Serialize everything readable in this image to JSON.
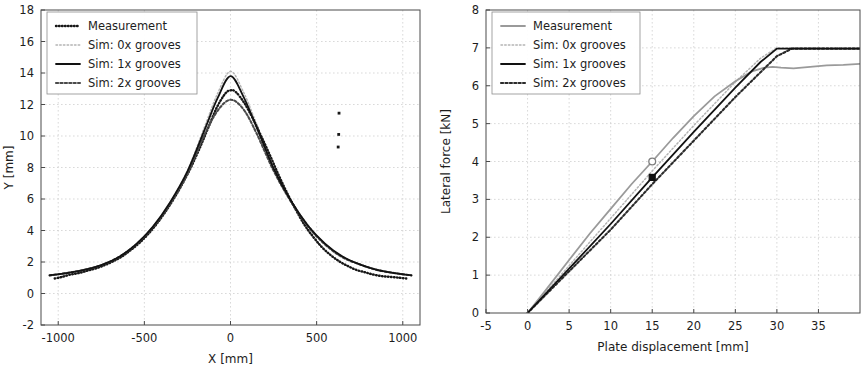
{
  "figure": {
    "background": "#ffffff",
    "panels": [
      "left",
      "right"
    ]
  },
  "series_style": {
    "measurement_color_left": "#171717",
    "measurement_color_right": "#9a9a9a",
    "sim0x_color": "#b4b4b4",
    "sim1x_color": "#121212",
    "sim2x_color": "#4a4a4a",
    "grid_color": "#c8c8c8",
    "frame_color": "#4a4a4a"
  },
  "chart_data": [
    {
      "id": "left",
      "type": "line",
      "title": "",
      "xlabel": "X [mm]",
      "ylabel": "Y [mm]",
      "xlim": [
        -1100,
        1100
      ],
      "ylim": [
        -2,
        18
      ],
      "xticks": [
        -1000,
        -500,
        0,
        500,
        1000
      ],
      "xticklabels": [
        "-1000",
        "-500",
        "0",
        "500",
        "1000"
      ],
      "yticks": [
        -2,
        0,
        2,
        4,
        6,
        8,
        10,
        12,
        14,
        16,
        18
      ],
      "yticklabels": [
        "-2",
        "0",
        "2",
        "4",
        "6",
        "8",
        "10",
        "12",
        "14",
        "16",
        "18"
      ],
      "grid": true,
      "legend_position": "upper-left",
      "legend": [
        "Measurement",
        "Sim: 0x grooves",
        "Sim: 1x grooves",
        "Sim: 2x grooves"
      ],
      "series": [
        {
          "name": "Measurement",
          "style": "dotted-markers",
          "color": "#171717",
          "x": [
            -1020,
            -980,
            -930,
            -880,
            -830,
            -780,
            -730,
            -680,
            -630,
            -580,
            -530,
            -480,
            -430,
            -380,
            -330,
            -280,
            -230,
            -180,
            -130,
            -80,
            -30,
            0,
            30,
            80,
            130,
            180,
            230,
            280,
            330,
            380,
            430,
            480,
            530,
            580,
            630,
            680,
            730,
            780,
            830,
            880,
            930,
            980,
            1020
          ],
          "y": [
            0.95,
            1.05,
            1.2,
            1.3,
            1.45,
            1.6,
            1.8,
            2.05,
            2.35,
            2.75,
            3.2,
            3.75,
            4.4,
            5.15,
            6.0,
            6.95,
            8.0,
            9.2,
            10.5,
            11.8,
            12.7,
            12.9,
            12.8,
            12.1,
            11.1,
            9.95,
            8.75,
            7.5,
            6.35,
            5.3,
            4.35,
            3.6,
            2.95,
            2.45,
            2.05,
            1.75,
            1.5,
            1.35,
            1.2,
            1.1,
            1.05,
            1.0,
            0.95
          ]
        },
        {
          "name": "Sim: 0x grooves",
          "style": "dotted",
          "color": "#b4b4b4",
          "x": [
            -1050,
            -950,
            -850,
            -750,
            -650,
            -550,
            -450,
            -350,
            -250,
            -150,
            -75,
            0,
            75,
            150,
            250,
            350,
            450,
            550,
            650,
            750,
            850,
            950,
            1050
          ],
          "y": [
            1.15,
            1.3,
            1.5,
            1.8,
            2.3,
            3.1,
            4.25,
            5.8,
            7.8,
            10.6,
            12.7,
            14.1,
            12.8,
            10.8,
            8.0,
            5.95,
            4.35,
            3.15,
            2.35,
            1.85,
            1.5,
            1.3,
            1.15
          ]
        },
        {
          "name": "Sim: 1x grooves",
          "style": "solid",
          "color": "#121212",
          "x": [
            -1050,
            -950,
            -850,
            -750,
            -650,
            -550,
            -450,
            -350,
            -250,
            -150,
            -75,
            0,
            75,
            150,
            250,
            350,
            450,
            550,
            650,
            750,
            850,
            950,
            1050
          ],
          "y": [
            1.15,
            1.3,
            1.5,
            1.8,
            2.3,
            3.1,
            4.25,
            5.8,
            7.75,
            10.4,
            12.4,
            13.8,
            12.5,
            10.6,
            7.95,
            5.9,
            4.3,
            3.15,
            2.35,
            1.85,
            1.5,
            1.3,
            1.15
          ]
        },
        {
          "name": "Sim: 2x grooves",
          "style": "dotted-thick",
          "color": "#4a4a4a",
          "x": [
            -1050,
            -950,
            -850,
            -750,
            -650,
            -550,
            -450,
            -350,
            -250,
            -150,
            -75,
            0,
            75,
            150,
            250,
            350,
            450,
            550,
            650,
            750,
            850,
            950,
            1050
          ],
          "y": [
            1.15,
            1.3,
            1.5,
            1.8,
            2.3,
            3.1,
            4.2,
            5.7,
            7.6,
            10.1,
            11.6,
            12.3,
            11.7,
            10.2,
            7.8,
            5.85,
            4.25,
            3.1,
            2.3,
            1.85,
            1.5,
            1.3,
            1.15
          ]
        }
      ],
      "outlier_points": [
        {
          "x": 630,
          "y": 11.45
        },
        {
          "x": 628,
          "y": 10.1
        },
        {
          "x": 625,
          "y": 9.3
        }
      ]
    },
    {
      "id": "right",
      "type": "line",
      "title": "",
      "xlabel": "Plate displacement [mm]",
      "ylabel": "Lateral force [kN]",
      "xlim": [
        -5,
        40
      ],
      "ylim": [
        0,
        8
      ],
      "xticks": [
        -5,
        0,
        5,
        10,
        15,
        20,
        25,
        30,
        35
      ],
      "xticklabels": [
        "-5",
        "0",
        "5",
        "10",
        "15",
        "20",
        "25",
        "30",
        "35"
      ],
      "yticks": [
        0,
        1,
        2,
        3,
        4,
        5,
        6,
        7,
        8
      ],
      "yticklabels": [
        "0",
        "1",
        "2",
        "3",
        "4",
        "5",
        "6",
        "7",
        "8"
      ],
      "grid": true,
      "legend_position": "upper-left",
      "legend": [
        "Measurement",
        "Sim: 0x grooves",
        "Sim: 1x grooves",
        "Sim: 2x grooves"
      ],
      "series": [
        {
          "name": "Measurement",
          "style": "solid",
          "color": "#9a9a9a",
          "x": [
            0,
            2,
            5,
            7.5,
            10,
            12.5,
            15,
            17.5,
            20,
            22.5,
            25,
            27,
            28.5,
            29.5,
            30.5,
            32,
            34,
            36,
            38,
            40
          ],
          "y": [
            0,
            0.55,
            1.4,
            2.1,
            2.75,
            3.4,
            4.0,
            4.62,
            5.2,
            5.72,
            6.12,
            6.38,
            6.48,
            6.5,
            6.48,
            6.46,
            6.5,
            6.54,
            6.55,
            6.58
          ]
        },
        {
          "name": "Sim: 0x grooves",
          "style": "dotted",
          "color": "#b4b4b4",
          "x": [
            0,
            5,
            10,
            15,
            20,
            25,
            28,
            30,
            32,
            35,
            40
          ],
          "y": [
            0,
            1.25,
            2.5,
            3.75,
            4.95,
            6.1,
            6.72,
            7.0,
            7.0,
            7.0,
            7.0
          ]
        },
        {
          "name": "Sim: 1x grooves",
          "style": "solid",
          "color": "#121212",
          "x": [
            0,
            5,
            10,
            15,
            20,
            25,
            28,
            30,
            32,
            35,
            40
          ],
          "y": [
            0,
            1.17,
            2.35,
            3.58,
            4.78,
            5.95,
            6.62,
            6.98,
            6.98,
            6.98,
            6.98
          ]
        },
        {
          "name": "Sim: 2x grooves",
          "style": "dotted-thick",
          "color": "#2b2b2b",
          "x": [
            0,
            5,
            10,
            15,
            20,
            25,
            28,
            30,
            31.8,
            33,
            35,
            40
          ],
          "y": [
            0,
            1.1,
            2.2,
            3.4,
            4.55,
            5.7,
            6.35,
            6.78,
            6.98,
            6.98,
            6.98,
            6.98
          ]
        }
      ],
      "markers": [
        {
          "name": "open-circle-marker",
          "x": 15,
          "y": 4.0,
          "shape": "circle",
          "filled": false,
          "color": "#7d7d7d"
        },
        {
          "name": "filled-square-marker",
          "x": 15,
          "y": 3.58,
          "shape": "square",
          "filled": true,
          "color": "#101010"
        }
      ]
    }
  ]
}
